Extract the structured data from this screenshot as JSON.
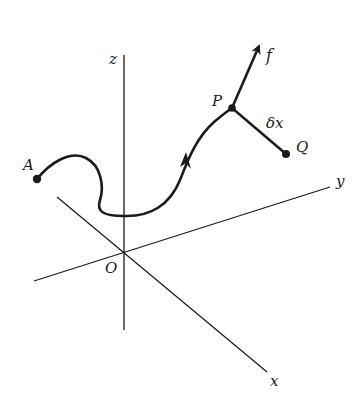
{
  "diagram": {
    "axes": {
      "x_label": "x",
      "y_label": "y",
      "z_label": "z",
      "origin_label": "O"
    },
    "points": {
      "A": "A",
      "P": "P",
      "Q": "Q"
    },
    "vectors": {
      "force": "f",
      "displacement": "δx"
    },
    "colors": {
      "ink": "#1a1a1a",
      "background": "#ffffff"
    }
  }
}
